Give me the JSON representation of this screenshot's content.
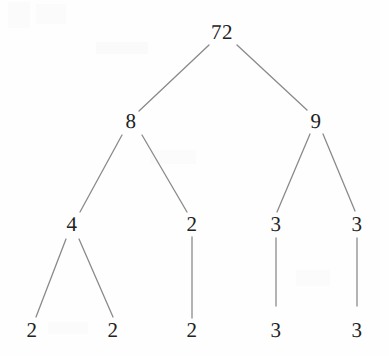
{
  "figure": {
    "kind": "factor-tree-diagram",
    "width": 389,
    "height": 356,
    "background_color": "#fefefe",
    "line_color": "#8a8a8a",
    "text_color": "#222222"
  },
  "chart_data": {
    "type": "diagram",
    "subtype": "factor-tree",
    "title": "",
    "root_value": "72",
    "nodes": [
      {
        "id": "n0",
        "label": "72",
        "level": 0,
        "x": 222,
        "y": 32
      },
      {
        "id": "n1",
        "label": "8",
        "level": 1,
        "x": 131,
        "y": 121
      },
      {
        "id": "n2",
        "label": "9",
        "level": 1,
        "x": 316,
        "y": 121
      },
      {
        "id": "n3",
        "label": "4",
        "level": 2,
        "x": 72,
        "y": 224
      },
      {
        "id": "n4",
        "label": "2",
        "level": 2,
        "x": 192,
        "y": 224
      },
      {
        "id": "n5",
        "label": "3",
        "level": 2,
        "x": 276,
        "y": 224
      },
      {
        "id": "n6",
        "label": "3",
        "level": 2,
        "x": 357,
        "y": 224
      },
      {
        "id": "n7",
        "label": "2",
        "level": 3,
        "x": 32,
        "y": 330
      },
      {
        "id": "n8",
        "label": "2",
        "level": 3,
        "x": 113,
        "y": 330
      },
      {
        "id": "n9",
        "label": "2",
        "level": 3,
        "x": 192,
        "y": 330
      },
      {
        "id": "n10",
        "label": "3",
        "level": 3,
        "x": 276,
        "y": 330
      },
      {
        "id": "n11",
        "label": "3",
        "level": 3,
        "x": 357,
        "y": 330
      }
    ],
    "edges": [
      {
        "from": "n0",
        "to": "n1",
        "x1": 209,
        "y1": 45,
        "x2": 139,
        "y2": 111
      },
      {
        "from": "n0",
        "to": "n2",
        "x1": 237,
        "y1": 45,
        "x2": 307,
        "y2": 110
      },
      {
        "from": "n1",
        "to": "n3",
        "x1": 122,
        "y1": 135,
        "x2": 80,
        "y2": 212
      },
      {
        "from": "n1",
        "to": "n4",
        "x1": 142,
        "y1": 135,
        "x2": 187,
        "y2": 212
      },
      {
        "from": "n2",
        "to": "n5",
        "x1": 310,
        "y1": 134,
        "x2": 277,
        "y2": 212
      },
      {
        "from": "n2",
        "to": "n6",
        "x1": 323,
        "y1": 134,
        "x2": 355,
        "y2": 211
      },
      {
        "from": "n3",
        "to": "n7",
        "x1": 66,
        "y1": 239,
        "x2": 36,
        "y2": 317
      },
      {
        "from": "n3",
        "to": "n8",
        "x1": 79,
        "y1": 239,
        "x2": 113,
        "y2": 317
      },
      {
        "from": "n4",
        "to": "n9",
        "x1": 192,
        "y1": 237,
        "x2": 192,
        "y2": 318
      },
      {
        "from": "n5",
        "to": "n10",
        "x1": 276,
        "y1": 238,
        "x2": 276,
        "y2": 306
      },
      {
        "from": "n6",
        "to": "n11",
        "x1": 357,
        "y1": 238,
        "x2": 357,
        "y2": 306
      }
    ],
    "factorization": [
      "2",
      "2",
      "2",
      "3",
      "3"
    ],
    "leaf_values": [
      "2",
      "2",
      "2",
      "3",
      "3"
    ]
  }
}
